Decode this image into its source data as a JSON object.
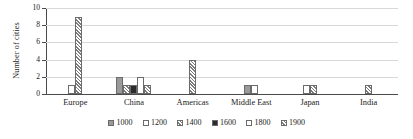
{
  "chart_data": {
    "type": "bar",
    "title": "",
    "xlabel": "",
    "ylabel": "Number of cities",
    "ylim": [
      0,
      10
    ],
    "yticks": [
      0,
      2,
      4,
      6,
      8,
      10
    ],
    "ytick_labels": [
      "0",
      "2",
      "4",
      "6",
      "8",
      "10"
    ],
    "grid": true,
    "legend_position": "bottom",
    "categories": [
      "Europe",
      "China",
      "Americas",
      "Middle East",
      "Japan",
      "India"
    ],
    "series": [
      {
        "name": "1000",
        "pattern": "solid-gray",
        "values": [
          0,
          2,
          0,
          1,
          0,
          0
        ]
      },
      {
        "name": "1200",
        "pattern": "white",
        "values": [
          0,
          0,
          0,
          1,
          0,
          0
        ]
      },
      {
        "name": "1400",
        "pattern": "diagonal-hatch",
        "values": [
          0,
          1,
          0,
          0,
          0,
          0
        ]
      },
      {
        "name": "1600",
        "pattern": "solid-black",
        "values": [
          0,
          1,
          0,
          0,
          0,
          0
        ]
      },
      {
        "name": "1800",
        "pattern": "white",
        "values": [
          1,
          2,
          0,
          0,
          1,
          0
        ]
      },
      {
        "name": "1900",
        "pattern": "diagonal-hatch",
        "values": [
          9,
          1,
          4,
          0,
          1,
          1
        ]
      }
    ]
  },
  "legend": {
    "items": [
      {
        "label": "1000",
        "key": "s1000"
      },
      {
        "label": "1200",
        "key": "s1200"
      },
      {
        "label": "1400",
        "key": "s1400"
      },
      {
        "label": "1600",
        "key": "s1600"
      },
      {
        "label": "1800",
        "key": "s1800"
      },
      {
        "label": "1900",
        "key": "s1900"
      }
    ]
  },
  "colors": {
    "axis": "#4a4a4a",
    "grid": "#d8d8d8",
    "bar_border": "#6b6b6b",
    "series_1000": "#9a9a9a",
    "series_1600": "#2b2b2b",
    "hatch": "#7d7d7d",
    "text": "#1a1a1a",
    "background": "#ffffff"
  }
}
